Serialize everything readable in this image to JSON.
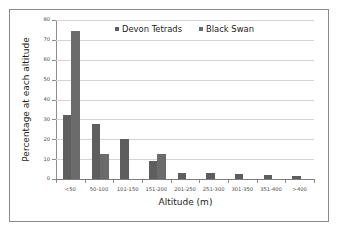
{
  "chart_data": {
    "type": "bar",
    "title": "",
    "xlabel": "Altitude (m)",
    "ylabel": "Percentage at each altitude",
    "categories": [
      "<50",
      "50-100",
      "101-150",
      "151-200",
      "201-250",
      "251-300",
      "301-350",
      "351-400",
      ">400"
    ],
    "series": [
      {
        "name": "Devon Tetrads",
        "color": "#5e5e5e",
        "values": [
          32,
          27.8,
          20,
          9.2,
          3,
          3,
          2.4,
          1.9,
          1.4
        ]
      },
      {
        "name": "Black Swan",
        "color": "#6b6b6b",
        "values": [
          74.5,
          12.5,
          0,
          12.5,
          0,
          0,
          0,
          0,
          0
        ]
      }
    ],
    "ylim": [
      0,
      80
    ],
    "yticks": [
      0,
      10,
      20,
      30,
      40,
      50,
      60,
      70,
      80
    ],
    "ytick_labels": [
      "0",
      "10",
      "20",
      "30",
      "40",
      "50",
      "60",
      "70",
      "80"
    ],
    "grid": true,
    "legend_position": "top-center"
  },
  "legend": {
    "entries": [
      {
        "label": "Devon Tetrads"
      },
      {
        "label": "Black Swan"
      }
    ]
  }
}
